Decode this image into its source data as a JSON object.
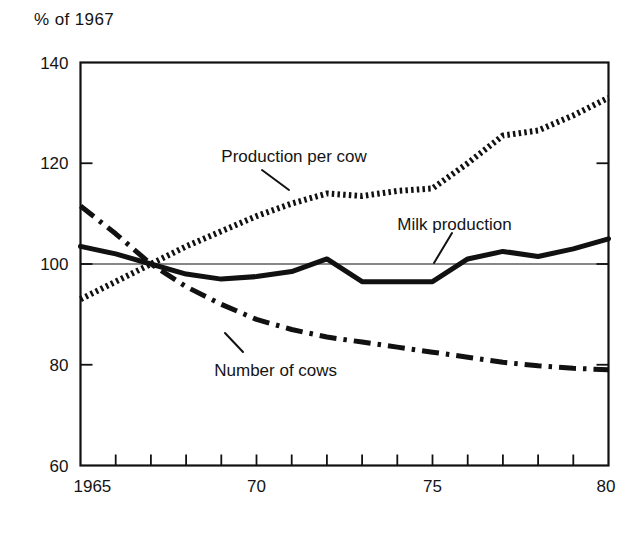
{
  "chart_data": {
    "type": "line",
    "title": "% of 1967",
    "xlabel": "",
    "ylabel": "% of 1967",
    "xlim": [
      1965,
      1980
    ],
    "ylim": [
      60,
      140
    ],
    "yticks": [
      60,
      80,
      100,
      120,
      140
    ],
    "ytick_labels": [
      "60",
      "80",
      "100",
      "120",
      "140"
    ],
    "xticks": [
      1965,
      1966,
      1967,
      1968,
      1969,
      1970,
      1971,
      1972,
      1973,
      1974,
      1975,
      1976,
      1977,
      1978,
      1979,
      1980
    ],
    "xtick_labels": [
      "1965",
      "",
      "",
      "",
      "",
      "70",
      "",
      "",
      "",
      "",
      "75",
      "",
      "",
      "",
      "",
      "80"
    ],
    "grid": false,
    "reference_line": 100,
    "legend_position": "inline-annotations",
    "x": [
      1965,
      1966,
      1967,
      1968,
      1969,
      1970,
      1971,
      1972,
      1973,
      1974,
      1975,
      1976,
      1977,
      1978,
      1979,
      1980
    ],
    "series": [
      {
        "name": "Production per cow",
        "style": "dotted",
        "color": "#111111",
        "values": [
          93.0,
          96.5,
          100.0,
          103.5,
          106.5,
          109.5,
          112.0,
          114.0,
          113.5,
          114.5,
          115.0,
          120.0,
          125.5,
          126.5,
          129.5,
          133.0
        ]
      },
      {
        "name": "Milk production",
        "style": "solid",
        "color": "#111111",
        "values": [
          103.5,
          102.0,
          100.0,
          98.0,
          97.0,
          97.5,
          98.5,
          101.0,
          96.5,
          96.5,
          96.5,
          101.0,
          102.5,
          101.5,
          103.0,
          105.0
        ]
      },
      {
        "name": "Number of cows",
        "style": "dash-dot",
        "color": "#111111",
        "values": [
          111.5,
          106.0,
          100.0,
          95.5,
          92.0,
          89.0,
          87.0,
          85.5,
          84.5,
          83.5,
          82.5,
          81.5,
          80.5,
          79.8,
          79.3,
          79.0
        ]
      }
    ],
    "annotations": [
      {
        "text": "Production per cow",
        "x": 1969.0,
        "y": 121.5
      },
      {
        "text": "Milk production",
        "x": 1974.0,
        "y": 108.0
      },
      {
        "text": "Number of cows",
        "x": 1968.8,
        "y": 79.0
      }
    ]
  }
}
